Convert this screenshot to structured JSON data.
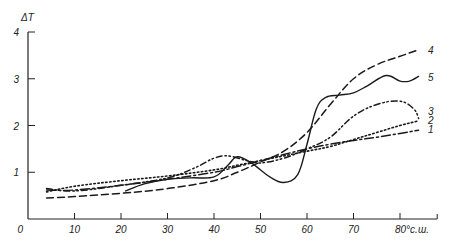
{
  "chart_data": {
    "type": "line",
    "title": "",
    "xlabel": "°с.ш.",
    "ylabel": "ΔT",
    "xlim": [
      0,
      88
    ],
    "ylim": [
      0,
      4
    ],
    "x_ticks": [
      0,
      10,
      20,
      30,
      40,
      50,
      60,
      70,
      80
    ],
    "x_tick_labels": [
      "0",
      "10",
      "20",
      "30",
      "40",
      "50",
      "60",
      "70",
      "80°с.ш."
    ],
    "y_ticks": [
      1,
      2,
      3,
      4
    ],
    "y_tick_labels": [
      "1",
      "2",
      "3",
      "4"
    ],
    "grid": false,
    "legend": "inline labels at right end of each curve",
    "series": [
      {
        "name": "1",
        "style": "dash-dot",
        "x": [
          4,
          10,
          20,
          30,
          40,
          45,
          50,
          55,
          60,
          65,
          70,
          75,
          80,
          84
        ],
        "y": [
          0.62,
          0.62,
          0.72,
          0.85,
          1.0,
          1.12,
          1.25,
          1.38,
          1.5,
          1.6,
          1.68,
          1.75,
          1.83,
          1.9
        ]
      },
      {
        "name": "2",
        "style": "dotted",
        "x": [
          4,
          10,
          20,
          30,
          40,
          45,
          50,
          55,
          60,
          65,
          70,
          75,
          80,
          84
        ],
        "y": [
          0.58,
          0.7,
          0.82,
          0.92,
          1.05,
          1.15,
          1.25,
          1.35,
          1.45,
          1.55,
          1.7,
          1.85,
          2.0,
          2.1
        ]
      },
      {
        "name": "3",
        "style": "dash-dot-dot",
        "x": [
          4,
          10,
          20,
          30,
          36,
          40,
          43,
          47,
          50,
          55,
          60,
          65,
          70,
          75,
          80,
          83,
          84
        ],
        "y": [
          0.65,
          0.6,
          0.72,
          0.88,
          1.1,
          1.3,
          1.35,
          1.25,
          1.2,
          1.3,
          1.5,
          1.75,
          2.2,
          2.45,
          2.52,
          2.35,
          2.15
        ]
      },
      {
        "name": "4",
        "style": "dashed",
        "x": [
          4,
          10,
          20,
          30,
          40,
          45,
          50,
          55,
          60,
          65,
          70,
          75,
          80,
          84
        ],
        "y": [
          0.45,
          0.48,
          0.55,
          0.65,
          0.82,
          1.0,
          1.22,
          1.45,
          1.85,
          2.45,
          3.0,
          3.3,
          3.48,
          3.62
        ]
      },
      {
        "name": "5",
        "style": "solid",
        "x": [
          21,
          25,
          30,
          35,
          40,
          43,
          45,
          48,
          52,
          55,
          58,
          60,
          62,
          64,
          67,
          70,
          73,
          77,
          80,
          82,
          84
        ],
        "y": [
          0.6,
          0.75,
          0.85,
          0.88,
          0.9,
          1.15,
          1.33,
          1.2,
          0.9,
          0.78,
          0.95,
          1.6,
          2.35,
          2.6,
          2.65,
          2.7,
          2.85,
          3.07,
          2.95,
          2.95,
          3.05
        ]
      }
    ]
  },
  "axes": {
    "y_title": "ΔT",
    "x_unit": "°с.ш.",
    "origin_label": "0"
  }
}
